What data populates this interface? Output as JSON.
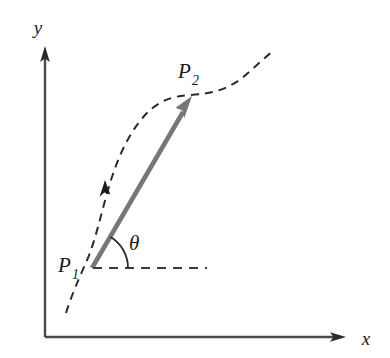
{
  "figure": {
    "kind": "vector-between-two-points-on-curve",
    "background_color": "#ffffff",
    "labels": {
      "y_axis": "y",
      "x_axis": "x",
      "point_start_base": "P",
      "point_start_sub": "1",
      "point_end_base": "P",
      "point_end_sub": "2",
      "angle": "θ"
    },
    "colors": {
      "axis": "#4a4a4a",
      "curve": "#2b2b2b",
      "vector": "#777777",
      "dashed_baseline": "#3a3a3a",
      "text": "#1a1a1a"
    },
    "geometry": {
      "origin": {
        "x": 45,
        "y": 337
      },
      "y_axis_tip": {
        "x": 45,
        "y": 48
      },
      "x_axis_tip": {
        "x": 345,
        "y": 337
      },
      "p1": {
        "x": 92,
        "y": 268
      },
      "p2": {
        "x": 192,
        "y": 97
      },
      "baseline_end": {
        "x": 207,
        "y": 268
      },
      "angle_arc_radius": 36,
      "angle_degrees": 60,
      "curve_start": {
        "x": 66,
        "y": 313
      },
      "curve_end": {
        "x": 272,
        "y": 52
      },
      "curve_arrow": {
        "x": 106,
        "y": 189
      }
    }
  }
}
